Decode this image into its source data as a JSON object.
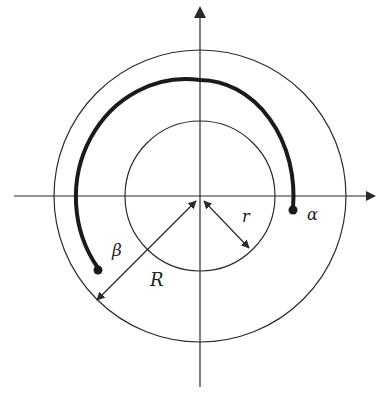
{
  "diagram": {
    "type": "polar-annulus",
    "labels": {
      "alpha": "α",
      "beta": "β",
      "outer_radius": "R",
      "inner_radius": "r"
    },
    "colors": {
      "stroke": "#2a2a2a",
      "background": "#ffffff"
    },
    "geometry": {
      "center": [
        200,
        196
      ],
      "outer_circle_radius": 146,
      "inner_circle_radius": 75,
      "arc_radius": 110,
      "x_axis": [
        14,
        376
      ],
      "y_axis": [
        6,
        387
      ]
    }
  }
}
